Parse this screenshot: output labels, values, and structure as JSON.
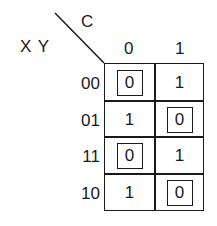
{
  "kmap": {
    "column_variable": "C",
    "row_variables": "X Y",
    "column_headers": [
      "0",
      "1"
    ],
    "rows": [
      {
        "label": "00",
        "cells": [
          {
            "value": "0",
            "boxed": true
          },
          {
            "value": "1",
            "boxed": false
          }
        ]
      },
      {
        "label": "01",
        "cells": [
          {
            "value": "1",
            "boxed": false
          },
          {
            "value": "0",
            "boxed": true
          }
        ]
      },
      {
        "label": "11",
        "cells": [
          {
            "value": "0",
            "boxed": true
          },
          {
            "value": "1",
            "boxed": false
          }
        ]
      },
      {
        "label": "10",
        "cells": [
          {
            "value": "1",
            "boxed": false
          },
          {
            "value": "0",
            "boxed": true
          }
        ]
      }
    ]
  }
}
